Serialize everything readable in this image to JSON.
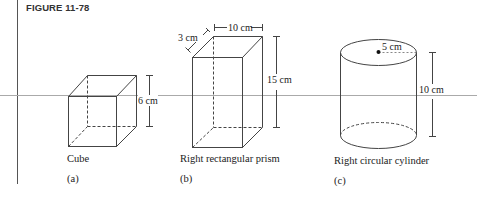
{
  "figure": {
    "title": "FIGURE 11-78",
    "panels": [
      {
        "id": "a",
        "name": "Cube",
        "caption": "(a)",
        "dimensions": {
          "edge": "6 cm"
        }
      },
      {
        "id": "b",
        "name": "Right rectangular prism",
        "caption": "(b)",
        "dimensions": {
          "depth": "3 cm",
          "width": "10 cm",
          "height": "15 cm"
        }
      },
      {
        "id": "c",
        "name": "Right circular cylinder",
        "caption": "(c)",
        "dimensions": {
          "radius": "5 cm",
          "height": "10 cm"
        }
      }
    ]
  },
  "colors": {
    "line": "#444444",
    "rule": "#999999"
  }
}
